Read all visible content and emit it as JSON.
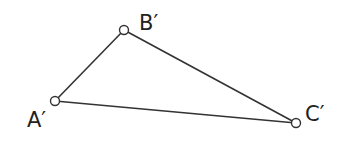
{
  "diagram": {
    "type": "triangle",
    "vertices": [
      {
        "id": "A",
        "label": "A′",
        "x": 55,
        "y": 101,
        "label_x": 27,
        "label_y": 127
      },
      {
        "id": "B",
        "label": "B′",
        "x": 124,
        "y": 30,
        "label_x": 139,
        "label_y": 30
      },
      {
        "id": "C",
        "label": "C′",
        "x": 296,
        "y": 123,
        "label_x": 305,
        "label_y": 121
      }
    ],
    "edges": [
      [
        "A",
        "B"
      ],
      [
        "B",
        "C"
      ],
      [
        "A",
        "C"
      ]
    ]
  }
}
